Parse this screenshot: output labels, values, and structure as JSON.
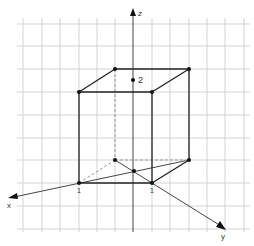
{
  "diagram": {
    "axes": {
      "x": {
        "label": "x"
      },
      "y": {
        "label": "y"
      },
      "z": {
        "label": "z"
      }
    },
    "tick_labels": {
      "x_one": "1",
      "y_one": "1",
      "z_two": "2"
    },
    "box": {
      "dimensions": {
        "x": 1,
        "y": 1,
        "z": 2
      }
    },
    "colors": {
      "grid": "#c8c8c8",
      "edge": "#222222",
      "axis": "#444444",
      "hidden_edge": "#999999"
    }
  }
}
